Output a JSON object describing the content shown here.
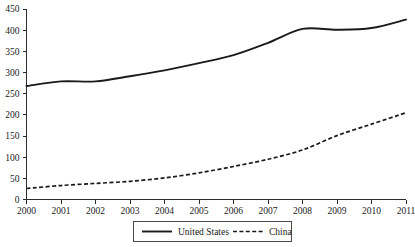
{
  "chart_data": {
    "type": "line",
    "title": "",
    "xlabel": "",
    "ylabel": "",
    "categories": [
      "2000",
      "2001",
      "2002",
      "2003",
      "2004",
      "2005",
      "2006",
      "2007",
      "2008",
      "2009",
      "2010",
      "2011"
    ],
    "series": [
      {
        "name": "United States",
        "style": "solid",
        "color": "#1a1a1a",
        "values": [
          268,
          279,
          279,
          291,
          305,
          322,
          341,
          370,
          403,
          401,
          405,
          425
        ]
      },
      {
        "name": "China",
        "style": "dashed",
        "color": "#1a1a1a",
        "values": [
          26,
          33,
          38,
          43,
          51,
          63,
          78,
          95,
          117,
          151,
          178,
          205
        ]
      }
    ],
    "ylim": [
      0,
      450
    ],
    "yticks": [
      0,
      50,
      100,
      150,
      200,
      250,
      300,
      350,
      400,
      450
    ],
    "ytick_labels": [
      "0",
      "50",
      "100",
      "150",
      "200",
      "250",
      "300",
      "350",
      "400",
      "450"
    ],
    "xtick_labels": [
      "2000",
      "2001",
      "2002",
      "2003",
      "2004",
      "2005",
      "2006",
      "2007",
      "2008",
      "2009",
      "2010",
      "2011"
    ],
    "grid": false,
    "legend_position": "bottom-center",
    "legend_entries": [
      {
        "label": "United States",
        "style": "solid"
      },
      {
        "label": "China",
        "style": "dashed"
      }
    ]
  }
}
